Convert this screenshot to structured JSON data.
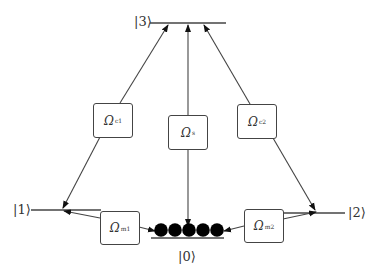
{
  "levels": {
    "ket3": "|3⟩",
    "ket1": "|1⟩",
    "ket2": "|2⟩",
    "ket0": "|0⟩"
  },
  "couplings": {
    "c1": {
      "symbol": "Ω",
      "sub": "c1"
    },
    "s": {
      "symbol": "Ω",
      "sub": "s"
    },
    "c2": {
      "symbol": "Ω",
      "sub": "c2"
    },
    "m1": {
      "symbol": "Ω",
      "sub": "m1"
    },
    "m2": {
      "symbol": "Ω",
      "sub": "m2"
    }
  },
  "atoms": {
    "count": 5,
    "color": "#000000"
  },
  "colors": {
    "line": "#444444",
    "text": "#333333"
  }
}
